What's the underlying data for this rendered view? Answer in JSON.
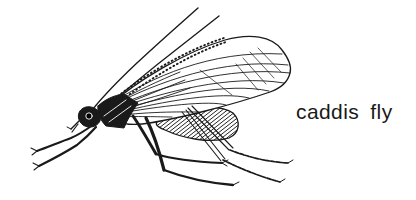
{
  "figure": {
    "caption": "caddis fly"
  },
  "colors": {
    "background": "#ffffff",
    "ink": "#1a1a1a"
  }
}
